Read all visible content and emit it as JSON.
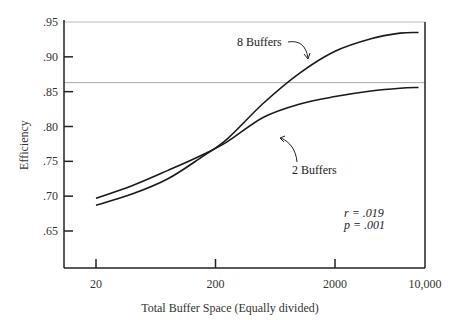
{
  "chart_data": {
    "type": "line",
    "title": "",
    "xlabel": "Total Buffer Space (Equally divided)",
    "ylabel": "Efficiency",
    "x_scale": "log",
    "x_ticks": [
      {
        "value": 20,
        "label": "20"
      },
      {
        "value": 200,
        "label": "200"
      },
      {
        "value": 2000,
        "label": "2000"
      },
      {
        "value": 10000,
        "label": "10,000"
      }
    ],
    "y_ticks": [
      {
        "value": 0.95,
        "label": ".95"
      },
      {
        "value": 0.9,
        "label": ".90"
      },
      {
        "value": 0.85,
        "label": ".85"
      },
      {
        "value": 0.8,
        "label": ".80"
      },
      {
        "value": 0.75,
        "label": ".75"
      },
      {
        "value": 0.7,
        "label": ".70"
      },
      {
        "value": 0.65,
        "label": ".65"
      }
    ],
    "ylim": [
      0.6,
      0.95
    ],
    "xlim": [
      10,
      10000
    ],
    "grid": false,
    "reference_lines": [
      0.95,
      0.863
    ],
    "series": [
      {
        "name": "8 Buffers",
        "label": "8 Buffers",
        "x": [
          20,
          40,
          80,
          150,
          250,
          500,
          1000,
          2000,
          4000,
          7000,
          10000
        ],
        "y": [
          0.687,
          0.703,
          0.725,
          0.755,
          0.782,
          0.833,
          0.876,
          0.908,
          0.926,
          0.934,
          0.935
        ]
      },
      {
        "name": "2 Buffers",
        "label": "2 Buffers",
        "x": [
          20,
          40,
          80,
          150,
          250,
          500,
          1000,
          2000,
          4000,
          7000,
          10000
        ],
        "y": [
          0.697,
          0.715,
          0.737,
          0.758,
          0.778,
          0.813,
          0.832,
          0.843,
          0.851,
          0.855,
          0.856
        ]
      }
    ],
    "annotations": [
      {
        "text": "r = .019"
      },
      {
        "text": "p = .001"
      }
    ]
  }
}
